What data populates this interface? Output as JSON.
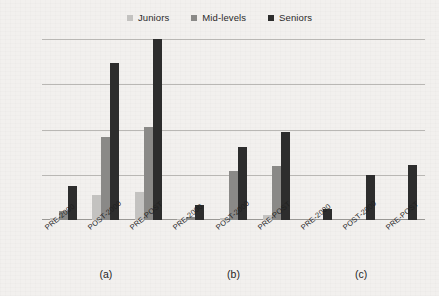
{
  "chart_data": {
    "type": "bar",
    "title": "",
    "subtitle": "",
    "xlabel": "",
    "ylabel": "",
    "ylim": [
      0,
      1000
    ],
    "yticks": [
      0,
      250,
      500,
      750,
      1000
    ],
    "ytick_labels": [
      "0",
      "250",
      "500",
      "750",
      "1,000"
    ],
    "grid": true,
    "legend_position": "top-center",
    "categories": [
      "PRE-2000",
      "POST-2000",
      "PRE-POST"
    ],
    "groups": [
      {
        "label": "(a)",
        "categories": [
          "PRE-2000",
          "POST-2000",
          "PRE-POST"
        ],
        "series": [
          {
            "name": "Juniors",
            "values": [
              12,
              140,
              155
            ]
          },
          {
            "name": "Mid-levels",
            "values": [
              50,
              460,
              515
            ]
          },
          {
            "name": "Seniors",
            "values": [
              190,
              870,
              1000
            ]
          }
        ]
      },
      {
        "label": "(b)",
        "categories": [
          "PRE-2000",
          "POST-2000",
          "PRE-POST"
        ],
        "series": [
          {
            "name": "Juniors",
            "values": [
              2,
              10,
              25
            ]
          },
          {
            "name": "Mid-levels",
            "values": [
              15,
              270,
              300
            ]
          },
          {
            "name": "Seniors",
            "values": [
              85,
              405,
              485
            ]
          }
        ]
      },
      {
        "label": "(c)",
        "categories": [
          "PRE-2000",
          "POST-2000",
          "PRE-POST"
        ],
        "series": [
          {
            "name": "Juniors",
            "values": [
              0,
              0,
              0
            ]
          },
          {
            "name": "Mid-levels",
            "values": [
              0,
              5,
              8
            ]
          },
          {
            "name": "Seniors",
            "values": [
              60,
              250,
              305
            ]
          }
        ]
      }
    ],
    "series_colors": {
      "Juniors": "#c3c2c0",
      "Mid-levels": "#8a8987",
      "Seniors": "#2d2d2d"
    }
  },
  "legend": {
    "items": [
      {
        "label": "Juniors",
        "color": "#c3c2c0",
        "key": "juniors"
      },
      {
        "label": "Mid-levels",
        "color": "#8a8987",
        "key": "mid"
      },
      {
        "label": "Seniors",
        "color": "#2d2d2d",
        "key": "sen"
      }
    ]
  },
  "colors": {
    "background": "#f2f0ee",
    "gridline": "#b9b7b4",
    "text": "#2b2b2b"
  }
}
